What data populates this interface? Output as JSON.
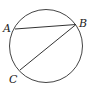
{
  "diagram": {
    "type": "circle-chords",
    "points": [
      {
        "id": "A",
        "label": "A"
      },
      {
        "id": "B",
        "label": "B"
      },
      {
        "id": "C",
        "label": "C"
      }
    ],
    "chords": [
      {
        "from": "A",
        "to": "B"
      },
      {
        "from": "B",
        "to": "C"
      }
    ],
    "stroke_color": "#333333"
  }
}
